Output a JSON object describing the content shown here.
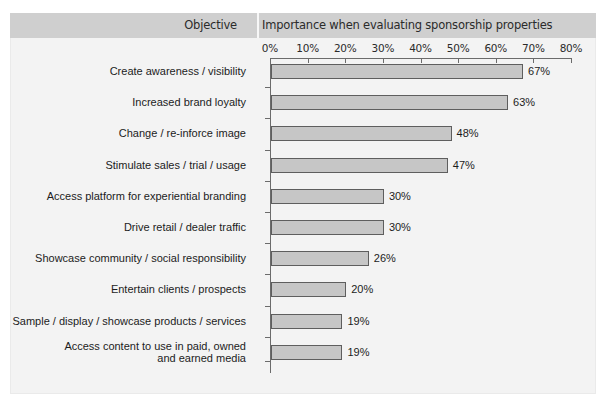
{
  "header": {
    "objective_label": "Objective",
    "importance_label": "Importance when evaluating sponsorship properties"
  },
  "colors": {
    "panel_background": "#f3f3f3",
    "header_band": "#cfcfcf",
    "bar_fill": "#c6c6c6",
    "bar_stroke": "#5e5e5e",
    "axis": "#6b6b6b",
    "text": "#1c1c1c"
  },
  "chart_data": {
    "type": "bar",
    "orientation": "horizontal",
    "title": "Importance when evaluating sponsorship properties",
    "xlabel": "",
    "ylabel": "Objective",
    "xlim": [
      0,
      80
    ],
    "grid": false,
    "legend": "none",
    "tick_labels": [
      "0%",
      "10%",
      "20%",
      "30%",
      "40%",
      "50%",
      "60%",
      "70%",
      "80%"
    ],
    "ticks": [
      0,
      10,
      20,
      30,
      40,
      50,
      60,
      70,
      80
    ],
    "categories": [
      "Create awareness / visibility",
      "Increased brand loyalty",
      "Change / re-inforce image",
      "Stimulate sales / trial / usage",
      "Access platform for experiential branding",
      "Drive retail / dealer traffic",
      "Showcase community / social responsibility",
      "Entertain clients / prospects",
      "Sample / display / showcase products / services",
      "Access content to use in paid, owned\nand earned media"
    ],
    "values": [
      67,
      63,
      48,
      47,
      30,
      30,
      26,
      20,
      19,
      19
    ],
    "data_labels": [
      "67%",
      "63%",
      "48%",
      "47%",
      "30%",
      "30%",
      "26%",
      "20%",
      "19%",
      "19%"
    ]
  }
}
